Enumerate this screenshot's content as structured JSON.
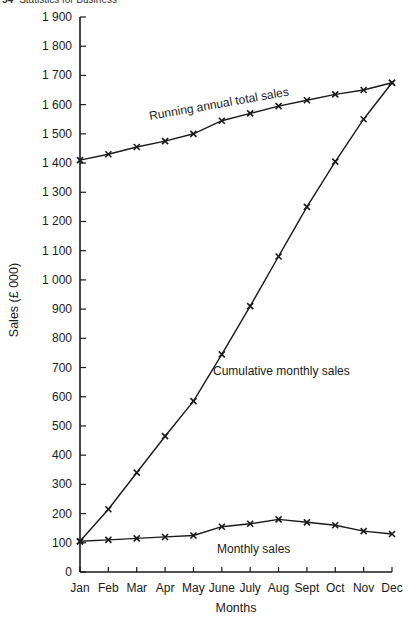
{
  "header": {
    "page_number": "54",
    "running_title": "Statistics for Business"
  },
  "chart_data": {
    "type": "line",
    "title": "",
    "xlabel": "Months",
    "ylabel": "Sales (£ 000)",
    "categories": [
      "Jan",
      "Feb",
      "Mar",
      "Apr",
      "May",
      "June",
      "July",
      "Aug",
      "Sept",
      "Oct",
      "Nov",
      "Dec"
    ],
    "yticks": [
      "0",
      "100",
      "200",
      "300",
      "400",
      "500",
      "600",
      "700",
      "800",
      "900",
      "1 000",
      "1 100",
      "1 200",
      "1 300",
      "1 400",
      "1 500",
      "1 600",
      "1 700",
      "1 800",
      "1 900"
    ],
    "ylim": [
      0,
      1900
    ],
    "grid": false,
    "marker": "x",
    "series": [
      {
        "name": "Running annual total sales",
        "values": [
          1410,
          1430,
          1455,
          1475,
          1500,
          1545,
          1570,
          1595,
          1615,
          1635,
          1650,
          1675
        ]
      },
      {
        "name": "Cumulative monthly sales",
        "values": [
          105,
          215,
          340,
          465,
          585,
          745,
          910,
          1080,
          1250,
          1405,
          1550,
          1675
        ]
      },
      {
        "name": "Monthly sales",
        "values": [
          105,
          110,
          115,
          120,
          125,
          155,
          165,
          180,
          170,
          160,
          140,
          130
        ]
      }
    ],
    "annotations": [
      {
        "text": "Running annual total sales",
        "x": 150,
        "y": 120,
        "rotate": -10
      },
      {
        "text": "Cumulative monthly sales",
        "x": 213,
        "y": 375,
        "rotate": 0
      },
      {
        "text": "Monthly sales",
        "x": 217,
        "y": 553,
        "rotate": 0
      }
    ]
  }
}
